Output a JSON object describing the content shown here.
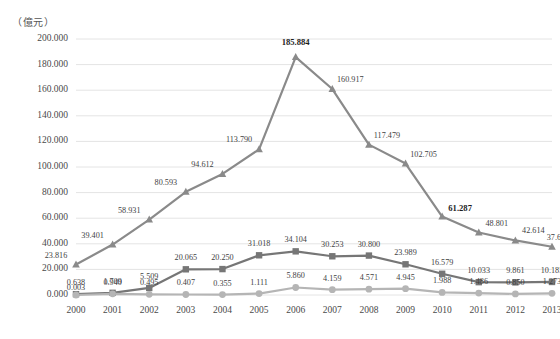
{
  "chart_data": {
    "type": "line",
    "title": "",
    "ylabel": "（億元）",
    "xlabel": "",
    "grid": true,
    "legend": "none",
    "ylim": [
      0,
      200
    ],
    "yticks": [
      "0.000",
      "20.000",
      "40.000",
      "60.000",
      "80.000",
      "100.000",
      "120.000",
      "140.000",
      "160.000",
      "180.000",
      "200.000"
    ],
    "categories": [
      "2000",
      "2001",
      "2002",
      "2003",
      "2004",
      "2005",
      "2006",
      "2007",
      "2008",
      "2009",
      "2010",
      "2011",
      "2012",
      "2013"
    ],
    "series": [
      {
        "name": "series-1",
        "color": "#8a8a8a",
        "marker": "triangle",
        "values": [
          23.816,
          39.401,
          58.931,
          80.593,
          94.612,
          113.79,
          185.884,
          160.917,
          117.479,
          102.705,
          61.287,
          48.801,
          42.614,
          37.682
        ],
        "labels": [
          "23.816",
          "39.401",
          "58.931",
          "80.593",
          "94.612",
          "113.790",
          "185.884",
          "160.917",
          "117.479",
          "102.705",
          "61.287",
          "48.801",
          "42.614",
          "37.682"
        ],
        "emphasized_labels": [
          "185.884",
          "61.287"
        ]
      },
      {
        "name": "series-2",
        "color": "#767676",
        "marker": "square",
        "values": [
          0.638,
          1.709,
          5.509,
          20.065,
          20.25,
          31.018,
          34.104,
          30.253,
          30.8,
          23.989,
          16.579,
          10.033,
          9.861,
          10.185
        ],
        "labels": [
          "0.638",
          "1.709",
          "5.509",
          "20.065",
          "20.250",
          "31.018",
          "34.104",
          "30.253",
          "30.800",
          "23.989",
          "16.579",
          "10.033",
          "9.861",
          "10.185"
        ]
      },
      {
        "name": "series-3",
        "color": "#b5b5b5",
        "marker": "circle",
        "values": [
          0.003,
          0.94,
          0.495,
          0.407,
          0.355,
          1.111,
          5.86,
          4.159,
          4.571,
          4.945,
          1.988,
          1.486,
          0.85,
          1.273
        ],
        "labels": [
          "0.003",
          "0.940",
          "0.495",
          "0.407",
          "0.355",
          "1.111",
          "5.860",
          "4.159",
          "4.571",
          "4.945",
          "1.988",
          "1.486",
          "0.850",
          "1.273"
        ]
      }
    ]
  },
  "colors": {
    "grid": "#e4e4e4",
    "text": "#4a4a4a",
    "series1": "#8a8a8a",
    "series2": "#767676",
    "series3": "#b5b5b5"
  }
}
